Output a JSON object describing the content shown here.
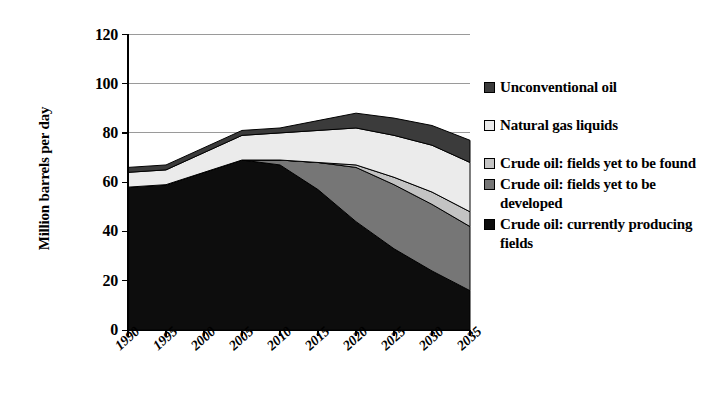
{
  "chart_data": {
    "type": "area",
    "stacked": true,
    "title": "",
    "xlabel": "",
    "ylabel": "Million barrels per day",
    "categories": [
      "1990",
      "1995",
      "2000",
      "2005",
      "2010",
      "2015",
      "2020",
      "2025",
      "2030",
      "2035"
    ],
    "x": [
      1990,
      1995,
      2000,
      2005,
      2010,
      2015,
      2020,
      2025,
      2030,
      2035
    ],
    "ylim": [
      0,
      120
    ],
    "yticks": [
      "0",
      "20",
      "40",
      "60",
      "80",
      "100",
      "120"
    ],
    "ytick_values": [
      0,
      20,
      40,
      60,
      80,
      100,
      120
    ],
    "grid": true,
    "legend_position": "right",
    "series": [
      {
        "name": "Crude oil: currently producing fields",
        "color": "#0d0d0d",
        "values": [
          58,
          59,
          64,
          69,
          67,
          57,
          44,
          33,
          24,
          16
        ]
      },
      {
        "name": "Crude oil: fields yet to be developed",
        "color": "#767676",
        "values": [
          0,
          0,
          0,
          0,
          2,
          11,
          22,
          26,
          27,
          26
        ]
      },
      {
        "name": "Crude oil: fields yet to be found",
        "color": "#c3c3c3",
        "values": [
          0,
          0,
          0,
          0,
          0,
          0,
          1,
          3,
          5,
          6
        ]
      },
      {
        "name": "Natural gas liquids",
        "color": "#ebebeb",
        "values": [
          6,
          6,
          8,
          10,
          11,
          13,
          15,
          17,
          19,
          20
        ]
      },
      {
        "name": "Unconventional oil",
        "color": "#3b3b3b",
        "values": [
          2,
          2,
          2,
          2,
          2,
          4,
          6,
          7,
          8,
          9
        ]
      }
    ],
    "totals": [
      66,
      67,
      74,
      81,
      80,
      85,
      88,
      86,
      83,
      77
    ]
  },
  "legend": {
    "items": [
      {
        "label": "Unconventional oil",
        "swatch": "#3b3b3b"
      },
      {
        "label": "Natural gas liquids",
        "swatch": "#ebebeb"
      },
      {
        "label": "Crude oil: fields yet to be found",
        "swatch": "#c3c3c3"
      },
      {
        "label": "Crude oil: fields yet to be developed",
        "swatch": "#767676"
      },
      {
        "label": "Crude oil: currently producing fields",
        "swatch": "#0d0d0d"
      }
    ]
  },
  "axis": {
    "y_title": "Million barrels per day"
  }
}
